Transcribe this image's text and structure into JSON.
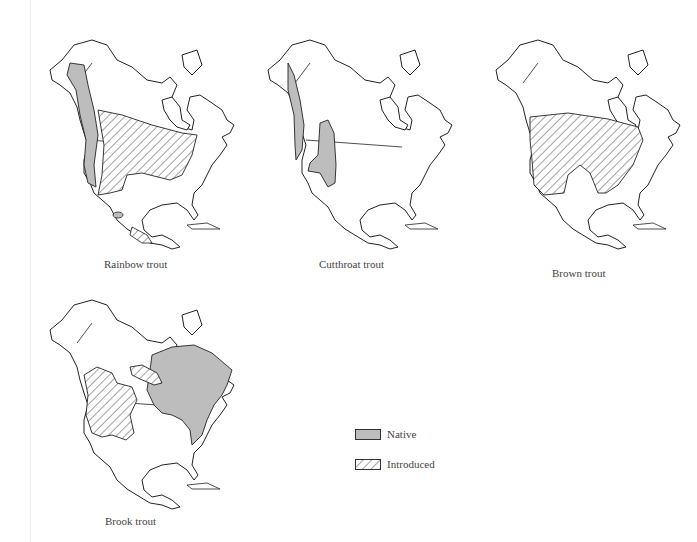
{
  "maps": [
    {
      "id": "rainbow",
      "caption": "Rainbow trout",
      "native": "Pacific coast from Alaska to Mexico",
      "introduced": "Interior Canada, US Midwest/Northeast, parts of Mexico"
    },
    {
      "id": "cutthroat",
      "caption": "Cutthroat trout",
      "native": "Pacific coast strip and interior Rocky Mountains",
      "introduced": "none"
    },
    {
      "id": "brown",
      "caption": "Brown trout",
      "native": "none",
      "introduced": "Southern Canada and most of the US"
    },
    {
      "id": "brook",
      "caption": "Brook trout",
      "native": "Eastern Canada, Great Lakes and Appalachians",
      "introduced": "Western US interior and central Canada"
    }
  ],
  "legend": {
    "native_label": "Native",
    "introduced_label": "Introduced",
    "native_color": "#bdbdbd",
    "outline_color": "#222222"
  }
}
